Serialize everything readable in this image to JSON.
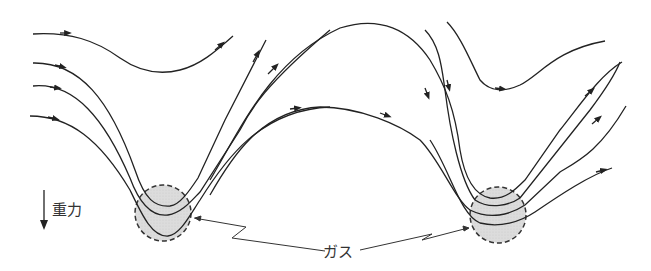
{
  "diagram": {
    "gravity_label": "重力",
    "gas_label": "ガス",
    "colors": {
      "line": "#222222",
      "gas_fill": "#d9d9d9",
      "background": "#ffffff"
    },
    "elements": {
      "gravity_arrow": "downward arrow indicating gravity direction",
      "gas_regions": [
        "left gas pocket (dashed circle)",
        "right gas pocket (dashed circle)"
      ],
      "streamlines": "curved flow lines with arrowheads dipping through gas pockets"
    }
  }
}
